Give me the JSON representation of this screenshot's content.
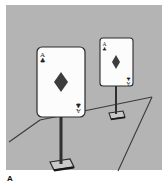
{
  "figure": {
    "label": "A",
    "caption_position": "bottom-left",
    "panel": {
      "background_color": "#b4b4b4",
      "x": 6,
      "y": 5,
      "width": 156,
      "height": 165
    },
    "page_background_color": "#ffffff",
    "ink_color": "#2a2a2a"
  },
  "scene": {
    "description": "Two playing cards mounted on vertical posts with flat square bases, standing on a floor plane drawn in perspective",
    "floor": {
      "line_color": "#3a3a3a",
      "edges": [
        {
          "name": "left-floor-edge",
          "x1": 9,
          "y1": 142,
          "x2": 40,
          "y2": 120
        },
        {
          "name": "back-floor-edge",
          "x1": 40,
          "y1": 120,
          "x2": 152,
          "y2": 97
        },
        {
          "name": "right-floor-edge",
          "x1": 152,
          "y1": 97,
          "x2": 118,
          "y2": 171
        }
      ]
    },
    "cards": [
      {
        "id": "near-card",
        "size": "large",
        "rank": "A",
        "suit_index": "club",
        "suit_center": "diamond",
        "card": {
          "x": 37,
          "y": 47,
          "width": 48,
          "height": 70,
          "radius": 5
        },
        "face_color": "#fcfcfc",
        "border_color": "#2a2a2a",
        "center_pip": {
          "cx": 61,
          "cy": 82,
          "size": 11
        },
        "post": {
          "x": 61,
          "y1": 117,
          "y2": 164,
          "width": 3
        },
        "base": {
          "cx": 61,
          "cy": 166,
          "width": 26,
          "height": 9
        }
      },
      {
        "id": "far-card",
        "size": "small",
        "rank": "A",
        "suit_index": "club",
        "suit_center": "diamond",
        "card": {
          "x": 100,
          "y": 38,
          "width": 33,
          "height": 48,
          "radius": 3
        },
        "face_color": "#fcfcfc",
        "border_color": "#2a2a2a",
        "center_pip": {
          "cx": 116,
          "cy": 62,
          "size": 8
        },
        "post": {
          "x": 116,
          "y1": 86,
          "y2": 114,
          "width": 2
        },
        "base": {
          "cx": 116,
          "cy": 116,
          "width": 18,
          "height": 6
        }
      }
    ]
  }
}
